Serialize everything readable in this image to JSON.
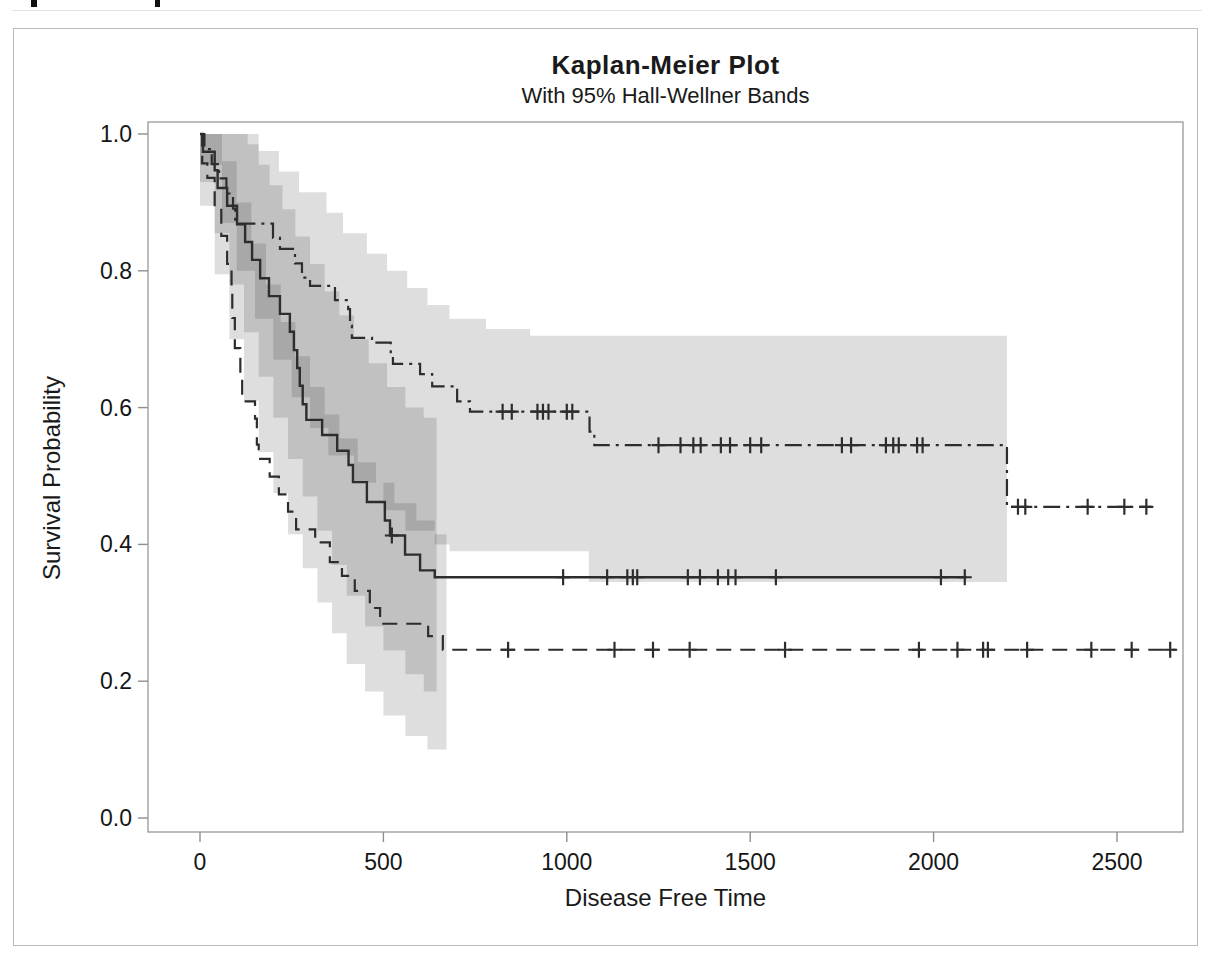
{
  "legend": {
    "censored_label": "+ Censored",
    "logrank_label": "Logrank p=0.0010",
    "position": "top-right"
  },
  "colors": {
    "curve": "#2d2d2d",
    "band_fill": "#000000",
    "band_opacity": 0.13,
    "frame": "#8f8f8f",
    "background": "#ffffff"
  },
  "chart_data": {
    "type": "line",
    "title": "Kaplan-Meier Plot",
    "subtitle": "With 95% Hall-Wellner Bands",
    "xlabel": "Disease Free Time",
    "ylabel": "Survival Probability",
    "xlim": [
      -142,
      2680
    ],
    "ylim": [
      -0.02,
      1.02
    ],
    "grid": false,
    "xtick_values": [
      0,
      500,
      1000,
      1500,
      2000,
      2500
    ],
    "xtick_labels": [
      "0",
      "500",
      "1000",
      "1500",
      "2000",
      "2500"
    ],
    "ytick_values": [
      0.0,
      0.2,
      0.4,
      0.6,
      0.8,
      1.0
    ],
    "ytick_labels": [
      "0.0",
      "0.2",
      "0.4",
      "0.6",
      "0.8",
      "1.0"
    ],
    "series": [
      {
        "name": "group-dashdot",
        "style": "dashdot",
        "end": 2595,
        "steps": [
          [
            0,
            1.0
          ],
          [
            12,
            0.978
          ],
          [
            32,
            0.956
          ],
          [
            52,
            0.935
          ],
          [
            72,
            0.913
          ],
          [
            90,
            0.891
          ],
          [
            96,
            0.869
          ],
          [
            199,
            0.848
          ],
          [
            218,
            0.832
          ],
          [
            259,
            0.811
          ],
          [
            278,
            0.79
          ],
          [
            300,
            0.778
          ],
          [
            368,
            0.757
          ],
          [
            404,
            0.744
          ],
          [
            409,
            0.72
          ],
          [
            414,
            0.702
          ],
          [
            469,
            0.695
          ],
          [
            520,
            0.678
          ],
          [
            526,
            0.664
          ],
          [
            600,
            0.649
          ],
          [
            633,
            0.631
          ],
          [
            701,
            0.609
          ],
          [
            736,
            0.594
          ],
          [
            1062,
            0.565
          ],
          [
            1075,
            0.545
          ],
          [
            2200,
            0.455
          ]
        ],
        "censored": [
          [
            825,
            0.594
          ],
          [
            850,
            0.594
          ],
          [
            920,
            0.594
          ],
          [
            935,
            0.594
          ],
          [
            950,
            0.594
          ],
          [
            1000,
            0.594
          ],
          [
            1015,
            0.594
          ],
          [
            1250,
            0.545
          ],
          [
            1310,
            0.545
          ],
          [
            1345,
            0.545
          ],
          [
            1365,
            0.545
          ],
          [
            1420,
            0.545
          ],
          [
            1445,
            0.545
          ],
          [
            1500,
            0.545
          ],
          [
            1530,
            0.545
          ],
          [
            1750,
            0.545
          ],
          [
            1775,
            0.545
          ],
          [
            1870,
            0.545
          ],
          [
            1890,
            0.545
          ],
          [
            1905,
            0.545
          ],
          [
            1955,
            0.545
          ],
          [
            1970,
            0.545
          ],
          [
            2230,
            0.455
          ],
          [
            2250,
            0.455
          ],
          [
            2420,
            0.455
          ],
          [
            2520,
            0.455
          ],
          [
            2580,
            0.455
          ]
        ]
      },
      {
        "name": "group-solid",
        "style": "solid",
        "end": 2090,
        "steps": [
          [
            0,
            1.0
          ],
          [
            8,
            0.974
          ],
          [
            40,
            0.947
          ],
          [
            48,
            0.921
          ],
          [
            74,
            0.895
          ],
          [
            101,
            0.868
          ],
          [
            123,
            0.842
          ],
          [
            142,
            0.816
          ],
          [
            164,
            0.789
          ],
          [
            188,
            0.763
          ],
          [
            218,
            0.737
          ],
          [
            245,
            0.711
          ],
          [
            256,
            0.684
          ],
          [
            265,
            0.658
          ],
          [
            272,
            0.632
          ],
          [
            280,
            0.605
          ],
          [
            290,
            0.582
          ],
          [
            333,
            0.56
          ],
          [
            374,
            0.537
          ],
          [
            405,
            0.516
          ],
          [
            417,
            0.491
          ],
          [
            455,
            0.462
          ],
          [
            504,
            0.435
          ],
          [
            518,
            0.413
          ],
          [
            559,
            0.385
          ],
          [
            600,
            0.362
          ],
          [
            640,
            0.352
          ]
        ],
        "censored": [
          [
            523,
            0.413
          ],
          [
            990,
            0.352
          ],
          [
            1110,
            0.352
          ],
          [
            1165,
            0.352
          ],
          [
            1180,
            0.352
          ],
          [
            1192,
            0.352
          ],
          [
            1330,
            0.352
          ],
          [
            1363,
            0.352
          ],
          [
            1412,
            0.352
          ],
          [
            1440,
            0.352
          ],
          [
            1460,
            0.352
          ],
          [
            1570,
            0.352
          ],
          [
            2020,
            0.352
          ],
          [
            2085,
            0.352
          ]
        ]
      },
      {
        "name": "group-dashed",
        "style": "dashed",
        "end": 2660,
        "steps": [
          [
            0,
            1.0
          ],
          [
            6,
            0.957
          ],
          [
            20,
            0.936
          ],
          [
            40,
            0.894
          ],
          [
            58,
            0.851
          ],
          [
            74,
            0.81
          ],
          [
            86,
            0.77
          ],
          [
            88,
            0.731
          ],
          [
            95,
            0.687
          ],
          [
            110,
            0.648
          ],
          [
            115,
            0.609
          ],
          [
            150,
            0.584
          ],
          [
            155,
            0.546
          ],
          [
            160,
            0.525
          ],
          [
            190,
            0.499
          ],
          [
            215,
            0.473
          ],
          [
            240,
            0.448
          ],
          [
            262,
            0.422
          ],
          [
            314,
            0.403
          ],
          [
            354,
            0.374
          ],
          [
            387,
            0.354
          ],
          [
            422,
            0.332
          ],
          [
            463,
            0.307
          ],
          [
            491,
            0.284
          ],
          [
            622,
            0.266
          ],
          [
            662,
            0.246
          ]
        ],
        "censored": [
          [
            840,
            0.246
          ],
          [
            1130,
            0.246
          ],
          [
            1235,
            0.246
          ],
          [
            1335,
            0.246
          ],
          [
            1595,
            0.246
          ],
          [
            1960,
            0.246
          ],
          [
            2065,
            0.246
          ],
          [
            2135,
            0.246
          ],
          [
            2148,
            0.246
          ],
          [
            2255,
            0.246
          ],
          [
            2430,
            0.246
          ],
          [
            2540,
            0.246
          ],
          [
            2645,
            0.246
          ]
        ]
      }
    ],
    "bands": [
      {
        "series": "group-dashdot",
        "end": 2200,
        "upper": [
          [
            0,
            1.0
          ],
          [
            160,
            0.975
          ],
          [
            215,
            0.945
          ],
          [
            270,
            0.915
          ],
          [
            345,
            0.885
          ],
          [
            390,
            0.855
          ],
          [
            455,
            0.825
          ],
          [
            510,
            0.8
          ],
          [
            565,
            0.775
          ],
          [
            620,
            0.75
          ],
          [
            680,
            0.73
          ],
          [
            780,
            0.715
          ],
          [
            900,
            0.705
          ]
        ],
        "lower": [
          [
            0,
            0.955
          ],
          [
            60,
            0.87
          ],
          [
            100,
            0.8
          ],
          [
            150,
            0.73
          ],
          [
            200,
            0.67
          ],
          [
            250,
            0.615
          ],
          [
            300,
            0.57
          ],
          [
            350,
            0.53
          ],
          [
            420,
            0.49
          ],
          [
            500,
            0.45
          ],
          [
            560,
            0.42
          ],
          [
            640,
            0.4
          ],
          [
            680,
            0.39
          ],
          [
            1060,
            0.345
          ]
        ]
      },
      {
        "series": "group-solid",
        "end": 645,
        "upper": [
          [
            0,
            1.0
          ],
          [
            130,
            0.985
          ],
          [
            160,
            0.955
          ],
          [
            190,
            0.925
          ],
          [
            225,
            0.89
          ],
          [
            260,
            0.85
          ],
          [
            300,
            0.81
          ],
          [
            340,
            0.77
          ],
          [
            380,
            0.735
          ],
          [
            420,
            0.7
          ],
          [
            460,
            0.665
          ],
          [
            510,
            0.63
          ],
          [
            560,
            0.6
          ],
          [
            610,
            0.585
          ]
        ],
        "lower": [
          [
            0,
            0.93
          ],
          [
            40,
            0.855
          ],
          [
            80,
            0.78
          ],
          [
            120,
            0.71
          ],
          [
            160,
            0.645
          ],
          [
            200,
            0.585
          ],
          [
            240,
            0.525
          ],
          [
            280,
            0.47
          ],
          [
            320,
            0.42
          ],
          [
            360,
            0.37
          ],
          [
            400,
            0.325
          ],
          [
            450,
            0.28
          ],
          [
            500,
            0.245
          ],
          [
            560,
            0.21
          ],
          [
            610,
            0.185
          ]
        ]
      },
      {
        "series": "group-dashed",
        "end": 672,
        "upper": [
          [
            0,
            1.0
          ],
          [
            60,
            0.96
          ],
          [
            100,
            0.9
          ],
          [
            140,
            0.84
          ],
          [
            180,
            0.78
          ],
          [
            220,
            0.725
          ],
          [
            260,
            0.675
          ],
          [
            300,
            0.63
          ],
          [
            340,
            0.59
          ],
          [
            380,
            0.555
          ],
          [
            430,
            0.52
          ],
          [
            480,
            0.49
          ],
          [
            530,
            0.46
          ],
          [
            590,
            0.435
          ],
          [
            640,
            0.415
          ]
        ],
        "lower": [
          [
            0,
            0.895
          ],
          [
            40,
            0.795
          ],
          [
            80,
            0.7
          ],
          [
            120,
            0.61
          ],
          [
            160,
            0.535
          ],
          [
            200,
            0.475
          ],
          [
            240,
            0.415
          ],
          [
            280,
            0.365
          ],
          [
            320,
            0.315
          ],
          [
            360,
            0.27
          ],
          [
            400,
            0.225
          ],
          [
            450,
            0.185
          ],
          [
            500,
            0.15
          ],
          [
            560,
            0.12
          ],
          [
            620,
            0.1
          ]
        ]
      }
    ]
  }
}
